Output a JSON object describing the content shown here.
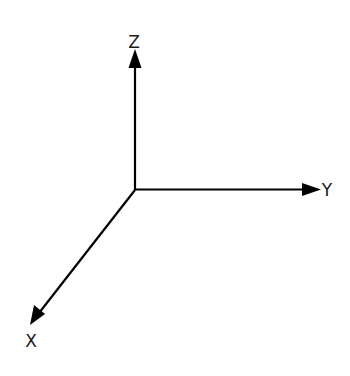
{
  "diagram": {
    "type": "3d-coordinate-axes",
    "origin": {
      "x": 135,
      "y": 190
    },
    "stroke_color": "#000000",
    "axes": [
      {
        "id": "z",
        "label": "Z",
        "direction": "up",
        "tip": {
          "x": 135,
          "y": 49
        }
      },
      {
        "id": "y",
        "label": "Y",
        "direction": "right",
        "tip": {
          "x": 320,
          "y": 189
        }
      },
      {
        "id": "x",
        "label": "X",
        "direction": "down-left",
        "tip": {
          "x": 30,
          "y": 325
        }
      }
    ]
  }
}
